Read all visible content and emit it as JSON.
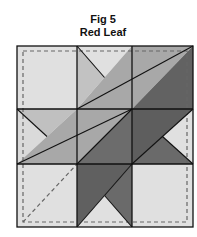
{
  "figure": {
    "number_label": "Fig 5",
    "name": "Red Leaf"
  },
  "colors": {
    "light": "#e0e0e0",
    "lighter_medium": "#c2c2c2",
    "medium": "#a8a8a8",
    "dark": "#626262",
    "dark2": "#6c6c6c",
    "line": "#111111",
    "dash": "#666666"
  },
  "quilt_block": {
    "grid": "3x3",
    "blocks": [
      {
        "row": 0,
        "col": 0,
        "type": "solid",
        "fill": "light"
      },
      {
        "row": 0,
        "col": 1,
        "type": "hourglass-half",
        "pieces": [
          "top:light",
          "left:lighter_medium",
          "lower-right:medium"
        ]
      },
      {
        "row": 0,
        "col": 2,
        "type": "half-square-triangle",
        "pieces": [
          "upper-left:medium",
          "lower-right:dark"
        ]
      },
      {
        "row": 1,
        "col": 0,
        "type": "hourglass-half",
        "pieces": [
          "left:light",
          "top:lighter_medium",
          "lower-right:medium"
        ]
      },
      {
        "row": 1,
        "col": 1,
        "type": "half-square-triangle",
        "pieces": [
          "upper-left:medium",
          "lower-right:dark"
        ]
      },
      {
        "row": 1,
        "col": 2,
        "type": "hourglass-half",
        "pieces": [
          "upper-left:dark",
          "right:light",
          "bottom:dark2"
        ]
      },
      {
        "row": 2,
        "col": 0,
        "type": "solid",
        "fill": "light"
      },
      {
        "row": 2,
        "col": 1,
        "type": "hourglass-half",
        "pieces": [
          "upper-left:dark",
          "bottom:light",
          "right:dark2"
        ]
      },
      {
        "row": 2,
        "col": 2,
        "type": "solid",
        "fill": "light"
      }
    ],
    "annotations": [
      "dashed seam-allowance border",
      "dashed stem line in bottom-left block"
    ]
  }
}
